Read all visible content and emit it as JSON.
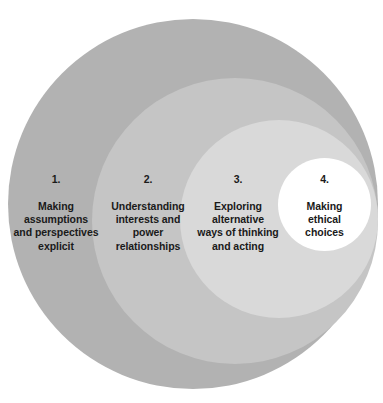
{
  "diagram": {
    "type": "nested-concentric-circles",
    "title": "",
    "background_color": "#ffffff",
    "stages": [
      {
        "number": "1.",
        "text": "Making\nassumptions\nand perspectives\nexplicit",
        "fill_color": "#b2b2b2",
        "text_color": "#1a1a1a"
      },
      {
        "number": "2.",
        "text": "Understanding\ninterests and\npower\nrelationships",
        "fill_color": "#c5c5c5",
        "text_color": "#1a1a1a"
      },
      {
        "number": "3.",
        "text": "Exploring\nalternative\nways of thinking\nand acting",
        "fill_color": "#d9d9d9",
        "text_color": "#1a1a1a"
      },
      {
        "number": "4.",
        "text": "Making\nethical\nchoices",
        "fill_color": "#ffffff",
        "text_color": "#1a1a1a"
      }
    ]
  }
}
